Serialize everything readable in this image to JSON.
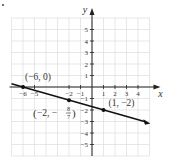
{
  "chart_data": {
    "type": "line",
    "title": "",
    "xlabel": "x",
    "ylabel": "y",
    "xlim": [
      -7,
      5
    ],
    "ylim": [
      -6,
      6
    ],
    "grid": true,
    "x_ticks": [
      -6,
      -5,
      -2,
      -1,
      1,
      2,
      3,
      4
    ],
    "x_tick_labels": [
      "−6",
      "−5",
      "−2",
      "−1",
      "1",
      "2",
      "3",
      "4"
    ],
    "y_ticks": [
      5,
      4,
      3,
      2,
      1,
      -1,
      -2,
      -3,
      -4,
      -5
    ],
    "y_tick_labels": [
      "5",
      "4",
      "3",
      "2",
      "1",
      "−1",
      "−2",
      "−3",
      "−4",
      "−5"
    ],
    "series": [
      {
        "name": "line",
        "equation": "y = -2/7 x - 12/7",
        "slope": -0.2857,
        "intercept": -1.7143,
        "x_range": [
          -7,
          4.9
        ]
      }
    ],
    "points": [
      {
        "x": -6,
        "y": 0,
        "label": "(−6, 0)"
      },
      {
        "x": -2,
        "y": -1.142857,
        "label": "(−2, −8/7)"
      },
      {
        "x": 1,
        "y": -2,
        "label": "(1, −2)"
      }
    ],
    "annotations": [
      {
        "text": "(−6, 0)",
        "x": -6,
        "y": 0
      },
      {
        "text": "(−2, −8/7)",
        "x": -2,
        "y": -1.142857
      },
      {
        "text": "(1, −2)",
        "x": 1,
        "y": -2
      }
    ]
  },
  "labels": {
    "x_axis": "x",
    "y_axis": "y",
    "p1": "(−6, 0)",
    "p2_prefix": "(−2, −",
    "p2_num": "8",
    "p2_den": "7",
    "p2_suffix": ")",
    "p3": "(1, −2)"
  }
}
